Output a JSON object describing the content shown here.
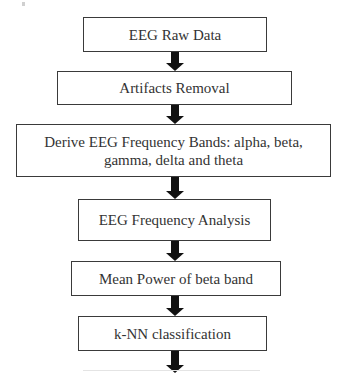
{
  "diagram": {
    "type": "flowchart",
    "direction": "top-to-bottom",
    "steps": [
      {
        "label": "EEG Raw Data"
      },
      {
        "label": "Artifacts Removal"
      },
      {
        "label": "Derive EEG Frequency Bands: alpha, beta, gamma, delta and theta"
      },
      {
        "label": "EEG Frequency Analysis"
      },
      {
        "label": "Mean Power of beta band"
      },
      {
        "label": "k-NN classification"
      }
    ],
    "arrow_icon": "down-arrow-icon",
    "colors": {
      "box_border": "#3a3a3a",
      "arrow": "#111111",
      "text": "#333333",
      "background": "#ffffff"
    }
  }
}
